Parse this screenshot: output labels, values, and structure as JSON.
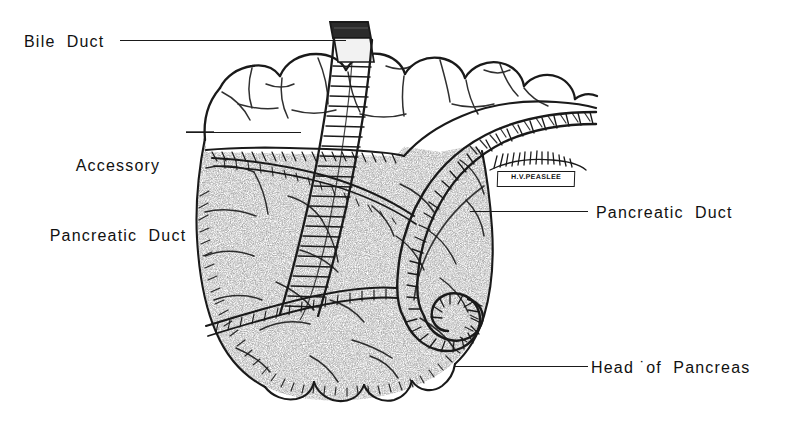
{
  "figure": {
    "background_color": "#ffffff",
    "ink_color": "#1a1a1a",
    "stipple_color": "#4a4a4a",
    "medium": "pen-and-ink anatomical line drawing"
  },
  "labels": {
    "bile_duct": "Bile  Duct",
    "accessory_line1": "Accessory",
    "accessory_line2": "Pancreatic  Duct",
    "pancreatic_duct": "Pancreatic  Duct",
    "head_of_pancreas": "Head ˙of  Pancreas"
  },
  "signature": {
    "text": "H.V.PEASLEE",
    "subtext": ""
  },
  "structures": [
    {
      "name": "duodenum",
      "description": "lobulated intestinal loop arching across upper portion"
    },
    {
      "name": "bile-duct",
      "description": "vertical cut tube with cross-hatched wall descending through pancreas head"
    },
    {
      "name": "accessory-pancreatic-duct",
      "description": "horizontal hatched duct crossing upper pancreas"
    },
    {
      "name": "pancreatic-duct",
      "description": "main duct curving downward in a spiral hook"
    },
    {
      "name": "head-of-pancreas",
      "description": "stippled glandular mass filling lower two thirds"
    }
  ]
}
